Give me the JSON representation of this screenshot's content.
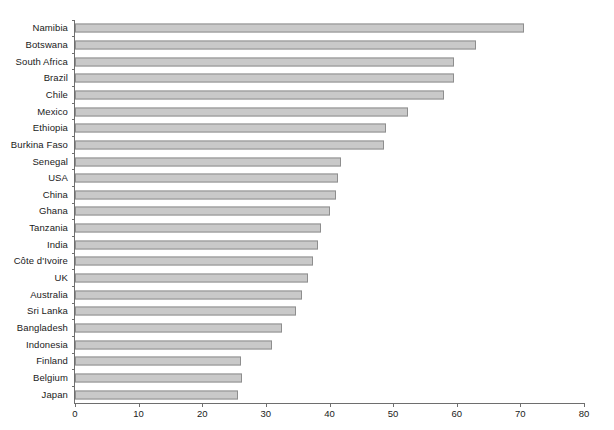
{
  "chart_data": {
    "type": "bar",
    "orientation": "horizontal",
    "title": "",
    "xlabel": "",
    "ylabel": "",
    "xlim": [
      0,
      80
    ],
    "xticks": [
      0,
      10,
      20,
      30,
      40,
      50,
      60,
      70,
      80
    ],
    "grid": false,
    "legend": null,
    "bar_color": "#c9c9c9",
    "bar_edge_color": "#8e8e8e",
    "axis_color": "#6e6e6e",
    "categories": [
      "Namibia",
      "Botswana",
      "South Africa",
      "Brazil",
      "Chile",
      "Mexico",
      "Ethiopia",
      "Burkina Faso",
      "Senegal",
      "USA",
      "China",
      "Ghana",
      "Tanzania",
      "India",
      "Côte d'Ivoire",
      "UK",
      "Australia",
      "Sri Lanka",
      "Bangladesh",
      "Indonesia",
      "Finland",
      "Belgium",
      "Japan"
    ],
    "values": [
      70.6,
      63.0,
      59.6,
      59.6,
      58.0,
      52.4,
      48.9,
      48.6,
      41.8,
      41.3,
      41.0,
      40.1,
      38.7,
      38.2,
      37.4,
      36.6,
      35.7,
      34.7,
      32.5,
      31.0,
      26.1,
      26.3,
      25.6
    ]
  },
  "caption": {
    "text": ""
  }
}
